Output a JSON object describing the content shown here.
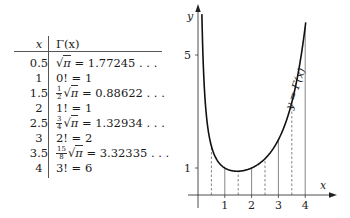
{
  "table": {
    "headers": {
      "x": "x",
      "gamma": "Γ(x)"
    },
    "rows": [
      {
        "x": "0.5",
        "coef_num": "",
        "coef_den": "",
        "has_sqrt": true,
        "lhs": "",
        "value": "= 1.77245 . . ."
      },
      {
        "x": "1",
        "coef_num": "",
        "coef_den": "",
        "has_sqrt": false,
        "lhs": "0! = 1",
        "value": ""
      },
      {
        "x": "1.5",
        "coef_num": "1",
        "coef_den": "2",
        "has_sqrt": true,
        "lhs": "",
        "value": "= 0.88622 . . ."
      },
      {
        "x": "2",
        "coef_num": "",
        "coef_den": "",
        "has_sqrt": false,
        "lhs": "1! = 1",
        "value": ""
      },
      {
        "x": "2.5",
        "coef_num": "3",
        "coef_den": "4",
        "has_sqrt": true,
        "lhs": "",
        "value": "= 1.32934 . . ."
      },
      {
        "x": "3",
        "coef_num": "",
        "coef_den": "",
        "has_sqrt": false,
        "lhs": "2! = 2",
        "value": ""
      },
      {
        "x": "3.5",
        "coef_num": "15",
        "coef_den": "8",
        "has_sqrt": true,
        "lhs": "",
        "value": "= 3.32335 . . ."
      },
      {
        "x": "4",
        "coef_num": "",
        "coef_den": "",
        "has_sqrt": false,
        "lhs": "3! = 6",
        "value": ""
      }
    ],
    "sqrt_symbol": "√",
    "pi_symbol": "π"
  },
  "graph": {
    "x_axis_label": "x",
    "y_axis_label": "y",
    "curve_label": "y = Γ(x)",
    "x_ticks": [
      "1",
      "2",
      "3",
      "4"
    ],
    "y_ticks": [
      "1",
      "5"
    ],
    "solid_guides_at_x": [
      1,
      2,
      3,
      4
    ],
    "dashed_guides_at_x": [
      0.5,
      1.5,
      2.5,
      3.5
    ]
  }
}
